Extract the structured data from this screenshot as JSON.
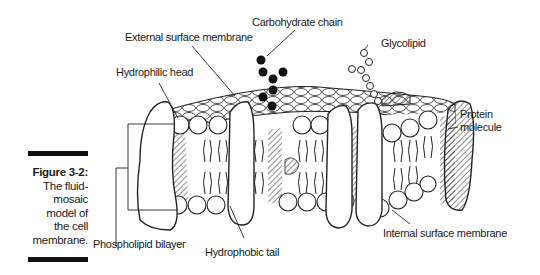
{
  "figure": {
    "number": "Figure 3-2:",
    "caption_lines": [
      "The fluid-",
      "mosaic",
      "model of",
      "the cell",
      "membrane."
    ]
  },
  "labels": {
    "carbohydrate_chain": "Carbohydrate chain",
    "external_surface_membrane": "External surface membrane",
    "glycolipid": "Glycolipid",
    "hydrophilic_head": "Hydrophilic head",
    "protein_molecule_line1": "Protein",
    "protein_molecule_line2": "molecule",
    "phospholipid_bilayer": "Phospholipid bilayer",
    "hydrophobic_tail": "Hydrophobic tail",
    "internal_surface_membrane": "Internal surface membrane"
  },
  "colors": {
    "ink": "#1a1a1a",
    "background": "#ffffff"
  }
}
